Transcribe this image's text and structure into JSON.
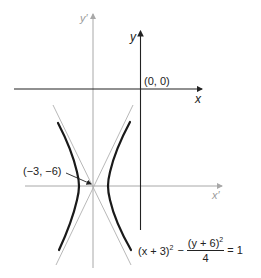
{
  "diagram": {
    "title": "",
    "axes": {
      "original": {
        "x_label": "x",
        "y_label": "y",
        "origin_label": "(0, 0)"
      },
      "translated": {
        "x_label": "x′",
        "y_label": "y′"
      }
    },
    "center_label": "(−3, −6)",
    "equation": {
      "lhs_first": "(x + 3)",
      "lhs_first_exp": "2",
      "minus": "−",
      "frac_num": "(y + 6)",
      "frac_num_exp": "2",
      "frac_den": "4",
      "rhs": "= 1"
    },
    "colors": {
      "curve": "#1a1a1a",
      "axis": "#222222",
      "translated_axis": "#a8a8a8",
      "asymptote": "#b0b0b0"
    }
  }
}
